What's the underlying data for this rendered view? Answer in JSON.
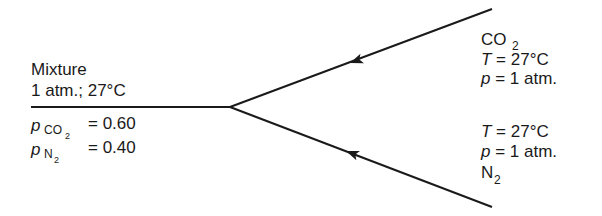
{
  "diagram": {
    "type": "gas-mixing-flow",
    "mixture": {
      "title": "Mixture",
      "conditions": "1 atm.; 27°C",
      "fractions": [
        {
          "symbol": "p",
          "species": "CO",
          "species_sub": "2",
          "value": "= 0.60"
        },
        {
          "symbol": "p",
          "species": "N",
          "species_sub": "2",
          "value": "= 0.40"
        }
      ]
    },
    "inlet_co2": {
      "species": "CO",
      "species_sub": "2",
      "temperature_symbol": "T",
      "temperature_value": " = 27°C",
      "pressure_symbol": "p",
      "pressure_value": " = 1 atm."
    },
    "inlet_n2": {
      "species": "N",
      "species_sub": "2",
      "temperature_symbol": "T",
      "temperature_value": " = 27°C",
      "pressure_symbol": "p",
      "pressure_value": " = 1 atm."
    },
    "colors": {
      "line": "#1a1a1a",
      "background": "#ffffff"
    }
  }
}
